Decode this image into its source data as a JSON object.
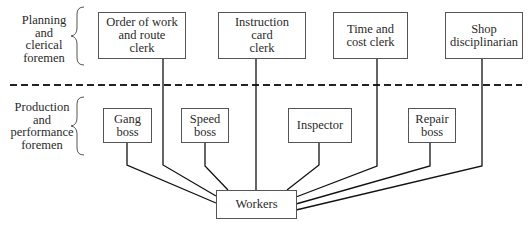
{
  "diagram": {
    "type": "functional-foremanship-org-chart",
    "groups": [
      {
        "id": "planning",
        "label": "Planning\nand\nclerical\nforemen"
      },
      {
        "id": "production",
        "label": "Production\nand\nperformance\nforemen"
      }
    ],
    "planning_foremen": [
      {
        "id": "order-of-work",
        "label": "Order of work\nand route\nclerk"
      },
      {
        "id": "instruction-card",
        "label": "Instruction\ncard\nclerk"
      },
      {
        "id": "time-and-cost",
        "label": "Time and\ncost clerk"
      },
      {
        "id": "shop-disciplinarian",
        "label": "Shop\ndisciplinarian"
      }
    ],
    "production_foremen": [
      {
        "id": "gang-boss",
        "label": "Gang\nboss"
      },
      {
        "id": "speed-boss",
        "label": "Speed\nboss"
      },
      {
        "id": "inspector",
        "label": "Inspector"
      },
      {
        "id": "repair-boss",
        "label": "Repair\nboss"
      }
    ],
    "workers": {
      "label": "Workers"
    },
    "edges": [
      [
        "order-of-work",
        "workers"
      ],
      [
        "instruction-card",
        "workers"
      ],
      [
        "time-and-cost",
        "workers"
      ],
      [
        "shop-disciplinarian",
        "workers"
      ],
      [
        "gang-boss",
        "workers"
      ],
      [
        "speed-boss",
        "workers"
      ],
      [
        "inspector",
        "workers"
      ],
      [
        "repair-boss",
        "workers"
      ]
    ],
    "separator": "dashed"
  }
}
